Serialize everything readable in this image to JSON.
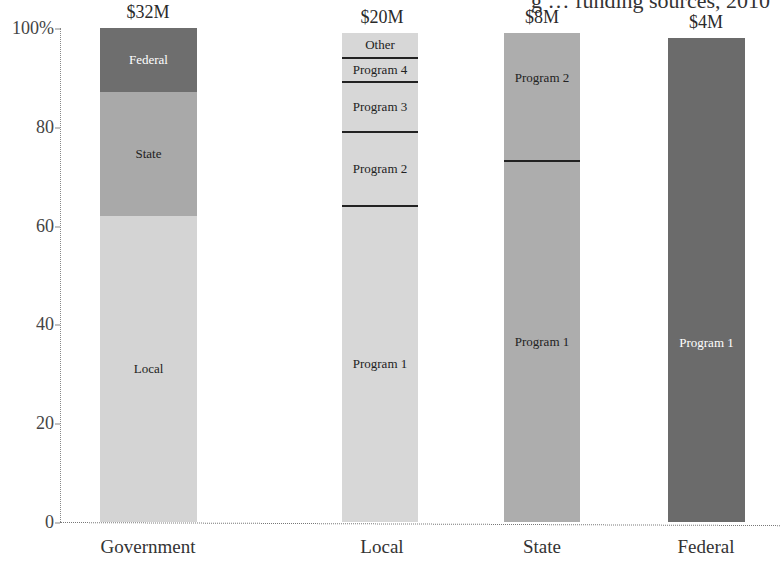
{
  "chart_data": {
    "type": "bar",
    "subtype": "stacked-100-percent",
    "title": "… funding sources, 2010",
    "title_visible_fragment": "g … funding sources, 2010",
    "xlabel": "",
    "ylabel": "",
    "ylim": [
      0,
      100
    ],
    "yticks": [
      "0",
      "20",
      "40",
      "60",
      "80",
      "100%"
    ],
    "grid": false,
    "legend": "inline segment labels",
    "categories": [
      "Government",
      "Local",
      "State",
      "Federal"
    ],
    "totals": [
      "$32M",
      "$20M",
      "$8M",
      "$4M"
    ],
    "bars": [
      {
        "category": "Government",
        "total": "$32M",
        "segments": [
          {
            "label": "Local",
            "value": 62,
            "color": "#d4d4d4",
            "text_color": "#222222"
          },
          {
            "label": "State",
            "value": 25,
            "color": "#a9a9a9",
            "text_color": "#222222"
          },
          {
            "label": "Federal",
            "value": 13,
            "color": "#6e6e6e",
            "text_color": "#ffffff"
          }
        ]
      },
      {
        "category": "Local",
        "total": "$20M",
        "segments": [
          {
            "label": "Program 1",
            "value": 64,
            "color": "#d7d7d7",
            "text_color": "#222222"
          },
          {
            "label": "Program 2",
            "value": 15,
            "color": "#d7d7d7",
            "text_color": "#222222"
          },
          {
            "label": "Program 3",
            "value": 10,
            "color": "#d7d7d7",
            "text_color": "#222222"
          },
          {
            "label": "Program 4",
            "value": 5,
            "color": "#d7d7d7",
            "text_color": "#222222"
          },
          {
            "label": "Other",
            "value": 5,
            "color": "#d7d7d7",
            "text_color": "#222222"
          }
        ]
      },
      {
        "category": "State",
        "total": "$8M",
        "segments": [
          {
            "label": "Program 1",
            "value": 73,
            "color": "#adadad",
            "text_color": "#222222"
          },
          {
            "label": "Program 2",
            "value": 26,
            "color": "#adadad",
            "text_color": "#222222"
          }
        ]
      },
      {
        "category": "Federal",
        "total": "$4M",
        "segments": [
          {
            "label": "Program 1",
            "value": 98,
            "color": "#6b6b6b",
            "text_color": "#ffffff"
          }
        ]
      }
    ]
  }
}
